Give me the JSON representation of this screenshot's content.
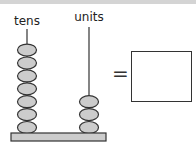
{
  "title": "",
  "abacus": {
    "columns": [
      {
        "label": "tens",
        "beads": 7
      },
      {
        "label": "units",
        "beads": 3
      }
    ],
    "bead_color": "#cccccc",
    "bead_stroke": "#333333",
    "base_color": "#cccccc"
  },
  "equation": {
    "symbol": "=",
    "answer": ""
  }
}
